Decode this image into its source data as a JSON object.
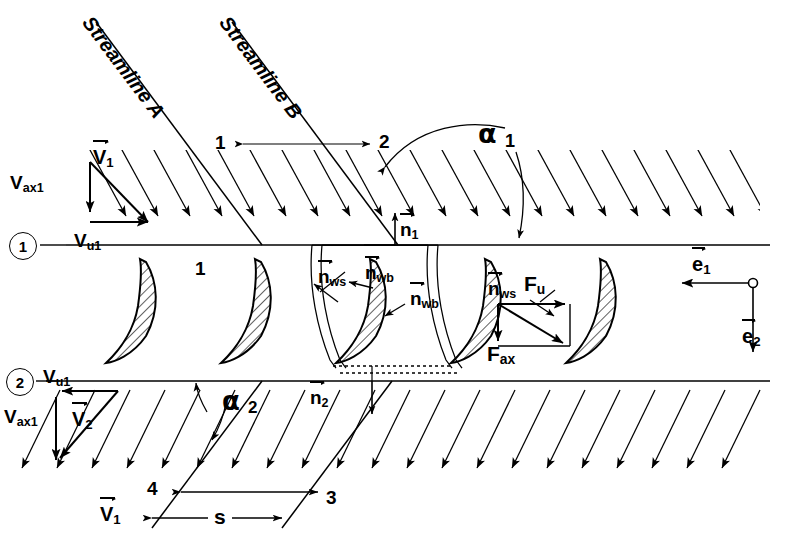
{
  "figure": {
    "type": "technical-diagram"
  },
  "streamlines": {
    "a_label": "Streamline A",
    "b_label": "Streamline B"
  },
  "stations": {
    "top_1": "1",
    "top_2": "2",
    "bottom_3": "3",
    "bottom_4": "4",
    "blade_row": "1",
    "circled_1": "1",
    "circled_2": "2"
  },
  "angles": {
    "alpha_1_sym": "α",
    "alpha_1_sub": "1",
    "alpha_2_sym": "α",
    "alpha_2_sub": "2"
  },
  "velocity_inlet": {
    "v1_sym": "V",
    "v1_sub": "1",
    "vax1_sym": "V",
    "vax1_sub": "ax1",
    "vu1_sym": "V",
    "vu1_sub": "u1"
  },
  "velocity_outlet": {
    "v2_sym": "V",
    "v2_sub": "2",
    "vax1_sym": "V",
    "vax1_sub": "ax1",
    "vu1_sym": "V",
    "vu1_sub": "u1",
    "v1_sym": "V",
    "v1_sub": "1"
  },
  "normals": {
    "n1_sym": "n",
    "n1_sub": "1",
    "n2_sym": "n",
    "n2_sub": "2",
    "nws_sym": "n",
    "nws_sub": "ws",
    "nwb_sym": "n",
    "nwb_sub": "wb"
  },
  "forces": {
    "fu_sym": "F",
    "fu_sub": "u",
    "fax_sym": "F",
    "fax_sub": "ax"
  },
  "unit_vectors": {
    "e1_sym": "e",
    "e1_sub": "1",
    "e2_sym": "e",
    "e2_sub": "2"
  },
  "pitch": {
    "s_label": "s"
  },
  "colors": {
    "ink": "#000000",
    "background": "#ffffff",
    "hatch": "#2b2b2b"
  }
}
